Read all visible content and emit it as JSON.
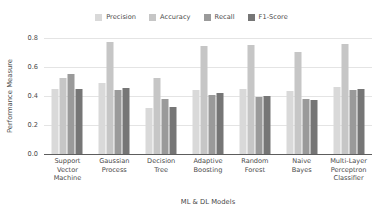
{
  "chart_data": {
    "type": "bar",
    "title": "",
    "xlabel": "ML & DL Models",
    "ylabel": "Performance Measure",
    "ylim": [
      0.0,
      0.8
    ],
    "yticks": [
      "0.0",
      "0.2",
      "0.4",
      "0.6",
      "0.8"
    ],
    "ytick_values": [
      0.0,
      0.2,
      0.4,
      0.6,
      0.8
    ],
    "grid": true,
    "legend_position": "top-center",
    "categories": [
      "Support\nVector\nMachine",
      "Gaussian\nProcess",
      "Decision\nTree",
      "Adaptive\nBoosting",
      "Random\nForest",
      "Naive\nBayes",
      "Multi-Layer\nPerceptron\nClassifier"
    ],
    "category_labels": [
      [
        "Support",
        "Vector",
        "Machine"
      ],
      [
        "Gaussian",
        "Process"
      ],
      [
        "Decision",
        "Tree"
      ],
      [
        "Adaptive",
        "Boosting"
      ],
      [
        "Random",
        "Forest"
      ],
      [
        "Naive",
        "Bayes"
      ],
      [
        "Multi-Layer",
        "Perceptron",
        "Classifier"
      ]
    ],
    "series": [
      {
        "name": "Precision",
        "color": "#d9d9d9",
        "values": [
          0.445,
          0.49,
          0.32,
          0.44,
          0.445,
          0.435,
          0.465
        ]
      },
      {
        "name": "Accuracy",
        "color": "#c6c6c6",
        "values": [
          0.525,
          0.775,
          0.525,
          0.745,
          0.75,
          0.705,
          0.76
        ]
      },
      {
        "name": "Recall",
        "color": "#9a9a9a",
        "values": [
          0.555,
          0.44,
          0.38,
          0.41,
          0.39,
          0.38,
          0.44
        ]
      },
      {
        "name": "F1-Score",
        "color": "#767676",
        "values": [
          0.45,
          0.455,
          0.325,
          0.42,
          0.4,
          0.375,
          0.45
        ]
      }
    ]
  }
}
